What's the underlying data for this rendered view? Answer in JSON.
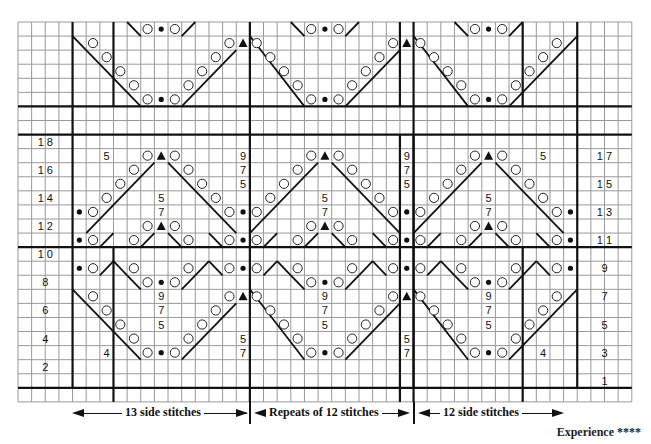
{
  "grid": {
    "x0": 18,
    "y0": 22,
    "cols": 45,
    "rows": 27,
    "cw": 13.64,
    "rh": 14.07,
    "line_color": "#999999",
    "thick_color": "#111111"
  },
  "thick_h": [
    6,
    8,
    16,
    26
  ],
  "thick_v_top": [
    {
      "c": 4,
      "r0": 0,
      "r1": 6
    },
    {
      "c": 7,
      "r0": 0,
      "r1": 6
    },
    {
      "c": 17,
      "r0": 0,
      "r1": 6
    },
    {
      "c": 28,
      "r0": 0,
      "r1": 6
    },
    {
      "c": 29,
      "r0": 0,
      "r1": 6
    },
    {
      "c": 37,
      "r0": 0,
      "r1": 6
    },
    {
      "c": 41,
      "r0": 0,
      "r1": 6
    },
    {
      "c": 4,
      "r0": 6,
      "r1": 8
    },
    {
      "c": 17,
      "r0": 6,
      "r1": 8
    },
    {
      "c": 29,
      "r0": 6,
      "r1": 8
    },
    {
      "c": 41,
      "r0": 6,
      "r1": 8
    }
  ],
  "thick_v_bottom": [
    {
      "c": 4,
      "r0": 8,
      "r1": 26
    },
    {
      "c": 17,
      "r0": 8,
      "r1": 27
    },
    {
      "c": 29,
      "r0": 8,
      "r1": 27
    },
    {
      "c": 41,
      "r0": 8,
      "r1": 26
    },
    {
      "c": 29,
      "r0": 8,
      "r1": 26
    },
    {
      "c": 7,
      "r0": 16,
      "r1": 27
    },
    {
      "c": 37,
      "r0": 16,
      "r1": 27
    },
    {
      "c": 28,
      "r0": 8,
      "r1": 27
    }
  ],
  "row_labels_left": [
    {
      "r": 8,
      "text": "1 8"
    },
    {
      "r": 10,
      "text": "1 6"
    },
    {
      "r": 12,
      "text": "1 4"
    },
    {
      "r": 14,
      "text": "1 2"
    },
    {
      "r": 16,
      "text": "1 0"
    },
    {
      "r": 18,
      "text": "8"
    },
    {
      "r": 20,
      "text": "6"
    },
    {
      "r": 22,
      "text": "4"
    },
    {
      "r": 24,
      "text": "2"
    }
  ],
  "row_labels_right": [
    {
      "r": 9,
      "text": "1 7"
    },
    {
      "r": 11,
      "text": "1 5"
    },
    {
      "r": 13,
      "text": "1 3"
    },
    {
      "r": 15,
      "text": "1 1"
    },
    {
      "r": 17,
      "text": "9"
    },
    {
      "r": 19,
      "text": "7"
    },
    {
      "r": 21,
      "text": "5"
    },
    {
      "r": 23,
      "text": "3"
    },
    {
      "r": 25,
      "text": "1"
    }
  ],
  "numbers": [
    {
      "c": 6,
      "r": 9,
      "t": "5"
    },
    {
      "c": 16,
      "r": 9,
      "t": "9"
    },
    {
      "c": 16,
      "r": 10,
      "t": "7"
    },
    {
      "c": 16,
      "r": 11,
      "t": "5"
    },
    {
      "c": 10,
      "r": 12,
      "t": "5"
    },
    {
      "c": 10,
      "r": 13,
      "t": "7"
    },
    {
      "c": 22,
      "r": 12,
      "t": "5"
    },
    {
      "c": 22,
      "r": 13,
      "t": "7"
    },
    {
      "c": 28,
      "r": 9,
      "t": "9"
    },
    {
      "c": 28,
      "r": 10,
      "t": "7"
    },
    {
      "c": 28,
      "r": 11,
      "t": "5"
    },
    {
      "c": 34,
      "r": 12,
      "t": "5"
    },
    {
      "c": 34,
      "r": 13,
      "t": "7"
    },
    {
      "c": 38,
      "r": 9,
      "t": "5"
    },
    {
      "c": 10,
      "r": 19,
      "t": "9"
    },
    {
      "c": 10,
      "r": 20,
      "t": "7"
    },
    {
      "c": 10,
      "r": 21,
      "t": "5"
    },
    {
      "c": 22,
      "r": 19,
      "t": "9"
    },
    {
      "c": 22,
      "r": 20,
      "t": "7"
    },
    {
      "c": 22,
      "r": 21,
      "t": "5"
    },
    {
      "c": 34,
      "r": 19,
      "t": "9"
    },
    {
      "c": 34,
      "r": 20,
      "t": "7"
    },
    {
      "c": 34,
      "r": 21,
      "t": "5"
    },
    {
      "c": 16,
      "r": 22,
      "t": "5"
    },
    {
      "c": 16,
      "r": 23,
      "t": "7"
    },
    {
      "c": 28,
      "r": 22,
      "t": "5"
    },
    {
      "c": 28,
      "r": 23,
      "t": "7"
    },
    {
      "c": 6,
      "r": 23,
      "t": "4"
    },
    {
      "c": 38,
      "r": 23,
      "t": "4"
    }
  ],
  "symbols": {
    "circles": [
      [
        9,
        0
      ],
      [
        11,
        0
      ],
      [
        21,
        0
      ],
      [
        23,
        0
      ],
      [
        33,
        0
      ],
      [
        35,
        0
      ],
      [
        5,
        1
      ],
      [
        15,
        1
      ],
      [
        17,
        1
      ],
      [
        27,
        1
      ],
      [
        29,
        1
      ],
      [
        39,
        1
      ],
      [
        6,
        2
      ],
      [
        14,
        2
      ],
      [
        18,
        2
      ],
      [
        26,
        2
      ],
      [
        30,
        2
      ],
      [
        38,
        2
      ],
      [
        7,
        3
      ],
      [
        13,
        3
      ],
      [
        19,
        3
      ],
      [
        25,
        3
      ],
      [
        31,
        3
      ],
      [
        37,
        3
      ],
      [
        8,
        4
      ],
      [
        12,
        4
      ],
      [
        20,
        4
      ],
      [
        24,
        4
      ],
      [
        32,
        4
      ],
      [
        36,
        4
      ],
      [
        9,
        5
      ],
      [
        11,
        5
      ],
      [
        21,
        5
      ],
      [
        23,
        5
      ],
      [
        33,
        5
      ],
      [
        35,
        5
      ],
      [
        9,
        9
      ],
      [
        11,
        9
      ],
      [
        21,
        9
      ],
      [
        23,
        9
      ],
      [
        33,
        9
      ],
      [
        35,
        9
      ],
      [
        8,
        10
      ],
      [
        12,
        10
      ],
      [
        20,
        10
      ],
      [
        24,
        10
      ],
      [
        32,
        10
      ],
      [
        36,
        10
      ],
      [
        7,
        11
      ],
      [
        13,
        11
      ],
      [
        19,
        11
      ],
      [
        25,
        11
      ],
      [
        31,
        11
      ],
      [
        37,
        11
      ],
      [
        6,
        12
      ],
      [
        14,
        12
      ],
      [
        18,
        12
      ],
      [
        26,
        12
      ],
      [
        30,
        12
      ],
      [
        38,
        12
      ],
      [
        5,
        13
      ],
      [
        15,
        13
      ],
      [
        17,
        13
      ],
      [
        27,
        13
      ],
      [
        29,
        13
      ],
      [
        39,
        13
      ],
      [
        9,
        14
      ],
      [
        11,
        14
      ],
      [
        21,
        14
      ],
      [
        23,
        14
      ],
      [
        33,
        14
      ],
      [
        35,
        14
      ],
      [
        5,
        15
      ],
      [
        8,
        15
      ],
      [
        12,
        15
      ],
      [
        15,
        15
      ],
      [
        17,
        15
      ],
      [
        20,
        15
      ],
      [
        24,
        15
      ],
      [
        27,
        15
      ],
      [
        29,
        15
      ],
      [
        32,
        15
      ],
      [
        36,
        15
      ],
      [
        39,
        15
      ],
      [
        5,
        17
      ],
      [
        8,
        17
      ],
      [
        12,
        17
      ],
      [
        15,
        17
      ],
      [
        17,
        17
      ],
      [
        20,
        17
      ],
      [
        24,
        17
      ],
      [
        27,
        17
      ],
      [
        29,
        17
      ],
      [
        32,
        17
      ],
      [
        36,
        17
      ],
      [
        39,
        17
      ],
      [
        9,
        18
      ],
      [
        11,
        18
      ],
      [
        21,
        18
      ],
      [
        23,
        18
      ],
      [
        33,
        18
      ],
      [
        35,
        18
      ],
      [
        5,
        19
      ],
      [
        15,
        19
      ],
      [
        17,
        19
      ],
      [
        27,
        19
      ],
      [
        29,
        19
      ],
      [
        39,
        19
      ],
      [
        6,
        20
      ],
      [
        14,
        20
      ],
      [
        18,
        20
      ],
      [
        26,
        20
      ],
      [
        30,
        20
      ],
      [
        38,
        20
      ],
      [
        7,
        21
      ],
      [
        13,
        21
      ],
      [
        19,
        21
      ],
      [
        25,
        21
      ],
      [
        31,
        21
      ],
      [
        37,
        21
      ],
      [
        8,
        22
      ],
      [
        12,
        22
      ],
      [
        20,
        22
      ],
      [
        24,
        22
      ],
      [
        32,
        22
      ],
      [
        36,
        22
      ],
      [
        9,
        23
      ],
      [
        11,
        23
      ],
      [
        21,
        23
      ],
      [
        23,
        23
      ],
      [
        33,
        23
      ],
      [
        35,
        23
      ]
    ],
    "dots": [
      [
        10,
        0
      ],
      [
        22,
        0
      ],
      [
        34,
        0
      ],
      [
        10,
        5
      ],
      [
        22,
        5
      ],
      [
        34,
        5
      ],
      [
        4,
        13
      ],
      [
        16,
        13
      ],
      [
        28,
        13
      ],
      [
        40,
        13
      ],
      [
        4,
        15
      ],
      [
        16,
        15
      ],
      [
        28,
        15
      ],
      [
        40,
        15
      ],
      [
        4,
        17
      ],
      [
        16,
        17
      ],
      [
        28,
        17
      ],
      [
        40,
        17
      ],
      [
        10,
        18
      ],
      [
        22,
        18
      ],
      [
        34,
        18
      ],
      [
        10,
        23
      ],
      [
        22,
        23
      ],
      [
        34,
        23
      ]
    ],
    "triangles": [
      [
        16,
        1
      ],
      [
        28,
        1
      ],
      [
        10,
        9
      ],
      [
        22,
        9
      ],
      [
        34,
        9
      ],
      [
        10,
        14
      ],
      [
        22,
        14
      ],
      [
        34,
        14
      ],
      [
        16,
        19
      ],
      [
        28,
        19
      ]
    ],
    "lines": [
      [
        [
          8,
          0
        ],
        [
          9,
          1
        ]
      ],
      [
        [
          12,
          1
        ],
        [
          13,
          0
        ]
      ],
      [
        [
          20,
          0
        ],
        [
          21,
          1
        ]
      ],
      [
        [
          24,
          1
        ],
        [
          25,
          0
        ]
      ],
      [
        [
          32,
          0
        ],
        [
          33,
          1
        ]
      ],
      [
        [
          36,
          1
        ],
        [
          37,
          0
        ]
      ],
      [
        [
          4,
          1
        ],
        [
          9,
          6
        ]
      ],
      [
        [
          17,
          1
        ],
        [
          21,
          6
        ]
      ],
      [
        [
          29,
          1
        ],
        [
          33,
          6
        ]
      ],
      [
        [
          16,
          2
        ],
        [
          12,
          6
        ]
      ],
      [
        [
          28,
          2
        ],
        [
          24,
          6
        ]
      ],
      [
        [
          41,
          1
        ],
        [
          36,
          6
        ]
      ],
      [
        [
          10,
          10
        ],
        [
          5,
          15
        ]
      ],
      [
        [
          11,
          10
        ],
        [
          16,
          15
        ]
      ],
      [
        [
          22,
          10
        ],
        [
          17,
          15
        ]
      ],
      [
        [
          23,
          10
        ],
        [
          28,
          15
        ]
      ],
      [
        [
          34,
          10
        ],
        [
          29,
          15
        ]
      ],
      [
        [
          35,
          10
        ],
        [
          40,
          15
        ]
      ],
      [
        [
          6,
          16
        ],
        [
          7,
          15
        ]
      ],
      [
        [
          9,
          16
        ],
        [
          10,
          15
        ]
      ],
      [
        [
          11,
          15
        ],
        [
          12,
          16
        ]
      ],
      [
        [
          14,
          15
        ],
        [
          15,
          16
        ]
      ],
      [
        [
          18,
          16
        ],
        [
          19,
          15
        ]
      ],
      [
        [
          21,
          16
        ],
        [
          22,
          15
        ]
      ],
      [
        [
          23,
          15
        ],
        [
          24,
          16
        ]
      ],
      [
        [
          26,
          15
        ],
        [
          27,
          16
        ]
      ],
      [
        [
          30,
          16
        ],
        [
          31,
          15
        ]
      ],
      [
        [
          33,
          16
        ],
        [
          34,
          15
        ]
      ],
      [
        [
          35,
          15
        ],
        [
          36,
          16
        ]
      ],
      [
        [
          38,
          15
        ],
        [
          39,
          16
        ]
      ],
      [
        [
          6,
          18
        ],
        [
          7,
          17
        ]
      ],
      [
        [
          7,
          17
        ],
        [
          8,
          18
        ]
      ],
      [
        [
          8,
          18
        ],
        [
          9,
          19
        ]
      ],
      [
        [
          12,
          19
        ],
        [
          13,
          18
        ]
      ],
      [
        [
          13,
          18
        ],
        [
          14,
          17
        ]
      ],
      [
        [
          14,
          17
        ],
        [
          15,
          18
        ]
      ],
      [
        [
          18,
          18
        ],
        [
          19,
          17
        ]
      ],
      [
        [
          19,
          17
        ],
        [
          20,
          18
        ]
      ],
      [
        [
          20,
          18
        ],
        [
          21,
          19
        ]
      ],
      [
        [
          24,
          19
        ],
        [
          25,
          18
        ]
      ],
      [
        [
          25,
          18
        ],
        [
          26,
          17
        ]
      ],
      [
        [
          26,
          17
        ],
        [
          27,
          18
        ]
      ],
      [
        [
          30,
          18
        ],
        [
          31,
          17
        ]
      ],
      [
        [
          31,
          17
        ],
        [
          32,
          18
        ]
      ],
      [
        [
          32,
          18
        ],
        [
          33,
          19
        ]
      ],
      [
        [
          36,
          19
        ],
        [
          37,
          18
        ]
      ],
      [
        [
          37,
          18
        ],
        [
          38,
          17
        ]
      ],
      [
        [
          38,
          17
        ],
        [
          39,
          18
        ]
      ],
      [
        [
          4,
          19
        ],
        [
          9,
          24
        ]
      ],
      [
        [
          17,
          19
        ],
        [
          21,
          24
        ]
      ],
      [
        [
          29,
          19
        ],
        [
          33,
          24
        ]
      ],
      [
        [
          16,
          20
        ],
        [
          12,
          24
        ]
      ],
      [
        [
          28,
          20
        ],
        [
          24,
          24
        ]
      ],
      [
        [
          41,
          19
        ],
        [
          36,
          24
        ]
      ]
    ]
  },
  "footer": {
    "side_left": "13 side stitches",
    "repeats": "Repeats of 12 stitches",
    "side_right": "12 side stitches",
    "experience": "Experience ****"
  }
}
